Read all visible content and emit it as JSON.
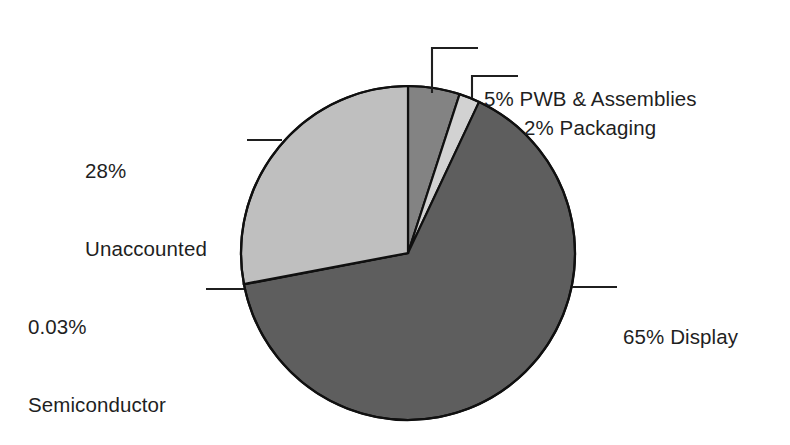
{
  "chart_data": {
    "type": "pie",
    "title": "",
    "subtitle": "",
    "xlabel": "",
    "ylabel": "",
    "legend_position": "none",
    "grid": false,
    "units": "percent",
    "total": 100.03,
    "start_angle_deg": 0,
    "direction": "clockwise",
    "categories": [
      "PWB & Assemblies",
      "Packaging",
      "Display",
      "Semiconductor",
      "Unaccounted"
    ],
    "values": [
      5,
      2,
      65,
      0.03,
      28
    ],
    "slices": [
      {
        "name": "PWB & Assemblies",
        "value": 5,
        "value_text": "5%",
        "label": "5% PWB & Assemblies",
        "color": "#838383",
        "start_deg": 0,
        "end_deg": 18
      },
      {
        "name": "Packaging",
        "value": 2,
        "value_text": "2%",
        "label": "2% Packaging",
        "color": "#d2d2d2",
        "start_deg": 18,
        "end_deg": 25.2
      },
      {
        "name": "Display",
        "value": 65,
        "value_text": "65%",
        "label": "65% Display",
        "color": "#5e5e5e",
        "start_deg": 25.2,
        "end_deg": 259.2
      },
      {
        "name": "Semiconductor",
        "value": 0.03,
        "value_text": "0.03%",
        "label": "0.03% Semiconductor",
        "color": "#121212",
        "start_deg": 259.2,
        "end_deg": 259.308
      },
      {
        "name": "Unaccounted",
        "value": 28,
        "value_text": "28%",
        "label": "28% Unaccounted",
        "color": "#bfbfbf",
        "start_deg": 259.308,
        "end_deg": 360
      }
    ],
    "geometry": {
      "center_x": 408,
      "center_y": 253,
      "radius": 167,
      "stroke": "#101010",
      "stroke_width": 2.2,
      "background": "#ffffff"
    }
  },
  "labels": {
    "pwb": {
      "line1": "5% PWB & Assemblies"
    },
    "packaging": {
      "line1": "2% Packaging"
    },
    "unaccounted": {
      "line1": "28%",
      "line2": "Unaccounted"
    },
    "semiconductor": {
      "line1": "0.03%",
      "line2": "Semiconductor"
    },
    "display": {
      "line1": "65% Display"
    }
  },
  "leaders": {
    "color": "#1f1f1f",
    "width": 2.1
  }
}
